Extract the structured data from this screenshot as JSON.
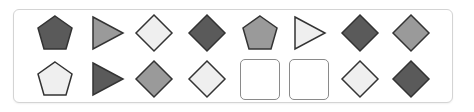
{
  "puzzle": {
    "colors": {
      "dark": "#5a5a5a",
      "medium": "#9a9a9a",
      "light": "#efefef",
      "stroke": "#333333"
    },
    "rows": [
      [
        {
          "shape": "pentagon",
          "fill": "dark"
        },
        {
          "shape": "triangle-right",
          "fill": "medium"
        },
        {
          "shape": "diamond",
          "fill": "light"
        },
        {
          "shape": "diamond",
          "fill": "dark"
        },
        {
          "shape": "pentagon",
          "fill": "medium"
        },
        {
          "shape": "triangle-right",
          "fill": "light"
        },
        {
          "shape": "diamond",
          "fill": "dark"
        },
        {
          "shape": "diamond",
          "fill": "medium"
        }
      ],
      [
        {
          "shape": "pentagon",
          "fill": "light"
        },
        {
          "shape": "triangle-right",
          "fill": "dark"
        },
        {
          "shape": "diamond",
          "fill": "medium"
        },
        {
          "shape": "diamond",
          "fill": "light"
        },
        {
          "shape": "empty",
          "fill": null
        },
        {
          "shape": "empty",
          "fill": null
        },
        {
          "shape": "diamond",
          "fill": "light"
        },
        {
          "shape": "diamond",
          "fill": "dark"
        }
      ]
    ]
  }
}
